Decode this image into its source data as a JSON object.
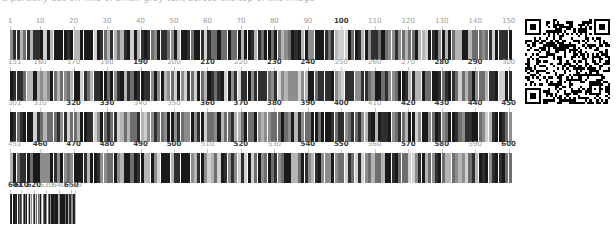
{
  "header": {
    "clipped_text": "a partially cut-off line of small grey text across the top of the image"
  },
  "document": {
    "title": "Sequence barcode map",
    "sequence_length": 653,
    "row_span": 150,
    "colors": {
      "bar_dark": "#1a1a1a",
      "bar_mid": "#6e6e6e",
      "bar_light": "#d0d0d0",
      "ruler_minor": "#9a9a9a",
      "ruler_major": "#3a3a3a",
      "tick": "#c9c9c9",
      "background": "#ffffff"
    }
  },
  "rows": [
    {
      "name": "row-1",
      "start": 1,
      "end": 150,
      "x": 10,
      "y": 17,
      "width": 502,
      "ticks": [
        {
          "label": "1",
          "pos": 1,
          "major": false
        },
        {
          "label": "10",
          "pos": 10,
          "major": false
        },
        {
          "label": "20",
          "pos": 20,
          "major": false
        },
        {
          "label": "30",
          "pos": 30,
          "major": false
        },
        {
          "label": "40",
          "pos": 40,
          "major": false
        },
        {
          "label": "50",
          "pos": 50,
          "major": false
        },
        {
          "label": "60",
          "pos": 60,
          "major": false
        },
        {
          "label": "70",
          "pos": 70,
          "major": false
        },
        {
          "label": "80",
          "pos": 80,
          "major": false
        },
        {
          "label": "90",
          "pos": 90,
          "major": false
        },
        {
          "label": "100",
          "pos": 100,
          "major": true
        },
        {
          "label": "110",
          "pos": 110,
          "major": false
        },
        {
          "label": "120",
          "pos": 120,
          "major": false
        },
        {
          "label": "130",
          "pos": 130,
          "major": false
        },
        {
          "label": "140",
          "pos": 140,
          "major": false
        },
        {
          "label": "150",
          "pos": 150,
          "major": false
        }
      ]
    },
    {
      "name": "row-2",
      "start": 151,
      "end": 300,
      "x": 10,
      "y": 58,
      "width": 502,
      "ticks": [
        {
          "label": "151",
          "pos": 151,
          "major": false
        },
        {
          "label": "160",
          "pos": 160,
          "major": false
        },
        {
          "label": "170",
          "pos": 170,
          "major": false
        },
        {
          "label": "180",
          "pos": 180,
          "major": false
        },
        {
          "label": "190",
          "pos": 190,
          "major": true
        },
        {
          "label": "200",
          "pos": 200,
          "major": false
        },
        {
          "label": "210",
          "pos": 210,
          "major": true
        },
        {
          "label": "220",
          "pos": 220,
          "major": false
        },
        {
          "label": "230",
          "pos": 230,
          "major": true
        },
        {
          "label": "240",
          "pos": 240,
          "major": true
        },
        {
          "label": "250",
          "pos": 250,
          "major": false
        },
        {
          "label": "260",
          "pos": 260,
          "major": false
        },
        {
          "label": "270",
          "pos": 270,
          "major": false
        },
        {
          "label": "280",
          "pos": 280,
          "major": true
        },
        {
          "label": "290",
          "pos": 290,
          "major": true
        },
        {
          "label": "300",
          "pos": 300,
          "major": false
        }
      ]
    },
    {
      "name": "row-3",
      "start": 301,
      "end": 450,
      "x": 10,
      "y": 99,
      "width": 502,
      "ticks": [
        {
          "label": "301",
          "pos": 301,
          "major": false
        },
        {
          "label": "310",
          "pos": 310,
          "major": false
        },
        {
          "label": "320",
          "pos": 320,
          "major": true
        },
        {
          "label": "330",
          "pos": 330,
          "major": true
        },
        {
          "label": "340",
          "pos": 340,
          "major": false
        },
        {
          "label": "350",
          "pos": 350,
          "major": false
        },
        {
          "label": "360",
          "pos": 360,
          "major": true
        },
        {
          "label": "370",
          "pos": 370,
          "major": true
        },
        {
          "label": "380",
          "pos": 380,
          "major": true
        },
        {
          "label": "390",
          "pos": 390,
          "major": true
        },
        {
          "label": "400",
          "pos": 400,
          "major": true
        },
        {
          "label": "410",
          "pos": 410,
          "major": false
        },
        {
          "label": "420",
          "pos": 420,
          "major": true
        },
        {
          "label": "430",
          "pos": 430,
          "major": true
        },
        {
          "label": "440",
          "pos": 440,
          "major": true
        },
        {
          "label": "450",
          "pos": 450,
          "major": true
        }
      ]
    },
    {
      "name": "row-4",
      "start": 451,
      "end": 600,
      "x": 10,
      "y": 140,
      "width": 502,
      "ticks": [
        {
          "label": "451",
          "pos": 451,
          "major": false
        },
        {
          "label": "460",
          "pos": 460,
          "major": true
        },
        {
          "label": "470",
          "pos": 470,
          "major": true
        },
        {
          "label": "480",
          "pos": 480,
          "major": true
        },
        {
          "label": "490",
          "pos": 490,
          "major": true
        },
        {
          "label": "500",
          "pos": 500,
          "major": true
        },
        {
          "label": "510",
          "pos": 510,
          "major": false
        },
        {
          "label": "520",
          "pos": 520,
          "major": true
        },
        {
          "label": "530",
          "pos": 530,
          "major": false
        },
        {
          "label": "540",
          "pos": 540,
          "major": true
        },
        {
          "label": "550",
          "pos": 550,
          "major": true
        },
        {
          "label": "560",
          "pos": 560,
          "major": false
        },
        {
          "label": "570",
          "pos": 570,
          "major": true
        },
        {
          "label": "580",
          "pos": 580,
          "major": true
        },
        {
          "label": "590",
          "pos": 590,
          "major": false
        },
        {
          "label": "600",
          "pos": 600,
          "major": true
        }
      ]
    },
    {
      "name": "row-5",
      "start": 601,
      "end": 653,
      "x": 10,
      "y": 181,
      "width": 188,
      "ticks": [
        {
          "label": "601",
          "pos": 601,
          "major": true
        },
        {
          "label": "610",
          "pos": 610,
          "major": true
        },
        {
          "label": "620",
          "pos": 620,
          "major": true
        },
        {
          "label": "630",
          "pos": 630,
          "major": false
        },
        {
          "label": "640",
          "pos": 640,
          "major": false
        },
        {
          "label": "650",
          "pos": 650,
          "major": true
        },
        {
          "label": "653",
          "pos": 653,
          "major": false
        }
      ]
    }
  ],
  "qr_code": {
    "name": "qr-code",
    "x": 525,
    "y": 19,
    "size": 85,
    "modules": 37,
    "alt": "QR code"
  }
}
